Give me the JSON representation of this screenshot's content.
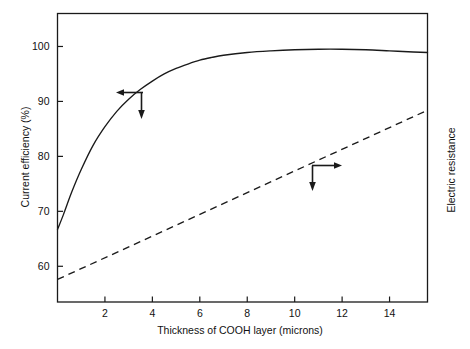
{
  "chart_data": {
    "type": "line",
    "title": "",
    "xlabel": "Thickness of COOH layer (microns)",
    "ylabel_left": "Current efficiency (%)",
    "ylabel_right": "Electric resistance",
    "grid": false,
    "legend": "none",
    "xlim": [
      0,
      15.6
    ],
    "ylim_left": [
      53.5,
      106
    ],
    "xticks": [
      2,
      4,
      6,
      8,
      10,
      12,
      14
    ],
    "xtick_labels": [
      "2",
      "4",
      "6",
      "8",
      "10",
      "12",
      "14"
    ],
    "yticks_left": [
      60,
      70,
      80,
      90,
      100
    ],
    "ytick_labels_left": [
      "60",
      "70",
      "80",
      "90",
      "100"
    ],
    "yticks_right": [],
    "ytick_labels_right": [],
    "series": [
      {
        "name": "Current efficiency",
        "style": "solid",
        "axis": "left",
        "color": "#1a1a1a",
        "x": [
          0.0,
          0.25,
          0.6,
          1.0,
          1.5,
          2.0,
          2.5,
          3.0,
          3.5,
          4.0,
          4.5,
          5.0,
          5.5,
          6.0,
          6.5,
          7.0,
          8.0,
          9.0,
          10.0,
          11.0,
          12.0,
          13.0,
          14.0,
          15.0,
          15.6
        ],
        "y": [
          66.7,
          69.4,
          73.5,
          77.6,
          82.0,
          85.4,
          88.2,
          90.4,
          92.2,
          93.7,
          95.0,
          96.0,
          96.8,
          97.5,
          98.0,
          98.4,
          98.9,
          99.2,
          99.4,
          99.5,
          99.5,
          99.4,
          99.2,
          99.0,
          98.9
        ]
      },
      {
        "name": "Electric resistance",
        "style": "dashed",
        "axis": "right",
        "color": "#1a1a1a",
        "x": [
          0.0,
          15.6
        ],
        "y_left_equiv": [
          57.6,
          88.4
        ]
      }
    ],
    "annotations": [
      {
        "name": "left-axis-pointer",
        "kind": "arrow-pair",
        "target_series": "Current efficiency",
        "arrow_horizontal_direction": "left",
        "arrow_vertical_direction": "down"
      },
      {
        "name": "right-axis-pointer",
        "kind": "arrow-pair",
        "target_series": "Electric resistance",
        "arrow_horizontal_direction": "right",
        "arrow_vertical_direction": "down"
      }
    ]
  },
  "axes": {
    "x_title": "Thickness of COOH layer (microns)",
    "y_left_title": "Current efficiency (%)",
    "y_right_title": "Electric resistance",
    "x_tick_labels": [
      "2",
      "4",
      "6",
      "8",
      "10",
      "12",
      "14"
    ],
    "y_left_tick_labels": [
      "100",
      "90",
      "80",
      "70",
      "60"
    ]
  },
  "colors": {
    "frame": "#1a1a1a",
    "curve": "#1a1a1a",
    "background": "#ffffff",
    "text": "#111111"
  }
}
